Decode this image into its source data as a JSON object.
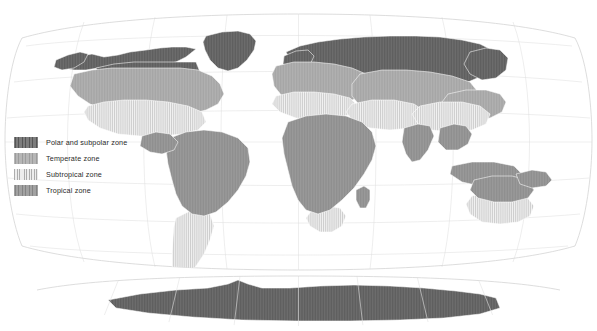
{
  "figure": {
    "kind": "world-climate-zone-map",
    "projection": "Robinson",
    "background_color": "#ffffff",
    "ocean_color": "#ffffff",
    "graticule_color": "#d8d8d8",
    "country_border_color": "#ffffff",
    "map_outline_color": "#cfcfcf",
    "width": 597,
    "height": 331
  },
  "legend": {
    "items": [
      {
        "id": "polar",
        "label": "Polar and subpolar zone",
        "color": "#6e6e6e",
        "hatch": "vertical",
        "swatch_class": "sw-polar"
      },
      {
        "id": "temperate",
        "label": "Temperate zone",
        "color": "#aeaeae",
        "hatch": "vertical",
        "swatch_class": "sw-temperate"
      },
      {
        "id": "subtropical",
        "label": "Subtropical zone",
        "color": "#ededed",
        "hatch": "vertical-light",
        "swatch_class": "sw-subtropical"
      },
      {
        "id": "tropical",
        "label": "Tropical zone",
        "color": "#979797",
        "hatch": "vertical",
        "swatch_class": "sw-tropical"
      }
    ]
  },
  "map_data": {
    "type": "choropleth-zones",
    "zone_order": [
      "polar",
      "temperate",
      "subtropical",
      "tropical"
    ],
    "landmasses": [
      {
        "name": "north-america-polar",
        "zone": "polar",
        "path": "M62,62 L74,57 L92,54 L104,57 L118,55 L130,52 L146,50 L160,48 L172,47 L186,47 L196,49 L186,57 L176,62 L166,64 L152,64 L140,63 L126,64 L112,66 L98,68 L86,70 L74,70 L64,68 Z"
      },
      {
        "name": "greenland-polar",
        "zone": "polar",
        "path": "M206,36 L222,32 L238,31 L250,34 L256,41 L254,50 L247,60 L238,68 L228,71 L218,68 L210,60 L205,50 L203,42 Z"
      },
      {
        "name": "alaska-polar",
        "zone": "polar",
        "path": "M56,60 L68,55 L80,52 L88,54 L84,62 L74,68 L62,70 L54,67 Z"
      },
      {
        "name": "canada-mid-polar",
        "zone": "polar",
        "path": "M96,68 L114,64 L134,62 L156,62 L178,62 L196,62 L200,72 L192,80 L176,84 L156,86 L136,86 L116,84 L100,78 Z"
      },
      {
        "name": "eurasia-polar-belt",
        "zone": "polar",
        "path": "M286,52 L300,46 L318,42 L340,39 L364,37 L390,36 L416,36 L440,37 L462,40 L480,44 L492,50 L496,58 L492,68 L482,76 L468,82 L448,86 L424,88 L398,88 L372,86 L348,82 L326,78 L306,72 L292,64 Z"
      },
      {
        "name": "scandinavia-polar",
        "zone": "polar",
        "path": "M284,56 L296,51 L308,50 L314,56 L310,65 L300,70 L290,70 L283,64 Z"
      },
      {
        "name": "siberia-ne-polar",
        "zone": "polar",
        "path": "M470,52 L486,48 L500,50 L508,58 L506,70 L496,78 L482,80 L470,74 L464,64 Z"
      },
      {
        "name": "mongolia-polar-lobe",
        "zone": "polar",
        "path": "M418,84 L436,80 L456,80 L470,84 L472,92 L462,98 L444,100 L426,98 L416,92 Z"
      },
      {
        "name": "north-america-temperate",
        "zone": "temperate",
        "path": "M74,74 L92,70 L112,68 L134,68 L158,68 L180,68 L198,70 L212,76 L220,84 L224,94 L218,104 L206,110 L190,114 L170,116 L148,116 L126,114 L106,110 L90,104 L78,96 L70,86 Z"
      },
      {
        "name": "europe-temperate",
        "zone": "temperate",
        "path": "M276,66 L294,62 L314,62 L334,64 L352,68 L366,74 L372,84 L366,94 L352,100 L334,104 L314,104 L296,102 L282,96 L274,86 L272,74 Z"
      },
      {
        "name": "central-asia-temperate",
        "zone": "temperate",
        "path": "M360,74 L382,70 L406,70 L430,72 L452,76 L470,82 L478,92 L474,102 L462,110 L444,114 L422,116 L398,116 L376,112 L360,106 L352,96 L352,84 Z"
      },
      {
        "name": "east-asia-temperate",
        "zone": "temperate",
        "path": "M448,94 L466,90 L486,90 L500,94 L506,102 L502,112 L490,118 L474,120 L458,118 L446,112 L442,102 Z"
      },
      {
        "name": "north-america-subtropical",
        "zone": "subtropical",
        "path": "M88,106 L104,102 L124,100 L146,100 L168,102 L188,106 L202,112 L206,122 L198,130 L182,134 L162,136 L140,136 L118,134 L100,128 L88,120 L84,112 Z"
      },
      {
        "name": "mediterranean-subtropical",
        "zone": "subtropical",
        "path": "M276,96 L294,92 L314,92 L334,94 L350,98 L358,106 L352,114 L336,118 L316,120 L296,118 L280,112 L272,104 Z"
      },
      {
        "name": "middle-east-subtropical",
        "zone": "subtropical",
        "path": "M352,104 L372,100 L394,100 L414,104 L426,112 L424,122 L410,128 L390,130 L370,128 L354,122 L346,112 Z"
      },
      {
        "name": "china-subtropical",
        "zone": "subtropical",
        "path": "M420,106 L440,102 L462,102 L480,106 L490,114 L486,124 L472,130 L452,132 L432,130 L418,124 L412,114 Z"
      },
      {
        "name": "south-america-subtropical",
        "zone": "subtropical",
        "path": "M176,218 L188,212 L200,210 L210,214 L214,226 L210,240 L204,254 L196,266 L188,276 L180,282 L174,278 L172,266 L172,252 L173,238 L174,226 Z"
      },
      {
        "name": "southern-africa-subtropical",
        "zone": "subtropical",
        "path": "M312,210 L326,206 L340,208 L346,216 L342,226 L332,232 L320,232 L310,226 L306,218 Z"
      },
      {
        "name": "australia-subtropical",
        "zone": "subtropical",
        "path": "M472,196 L490,192 L510,192 L526,196 L534,206 L530,216 L518,222 L500,224 L482,222 L470,214 L466,204 Z"
      },
      {
        "name": "south-america-tropical",
        "zone": "tropical",
        "path": "M170,138 L186,132 L204,130 L222,132 L238,138 L248,148 L250,162 L246,176 L238,190 L228,202 L216,212 L204,216 L192,214 L182,206 L176,194 L172,180 L168,164 L166,150 Z"
      },
      {
        "name": "central-america-tropical",
        "zone": "tropical",
        "path": "M142,136 L156,132 L170,134 L178,142 L174,150 L162,154 L150,152 L140,146 Z"
      },
      {
        "name": "africa-tropical",
        "zone": "tropical",
        "path": "M288,122 L306,116 L326,114 L346,116 L362,122 L372,132 L376,146 L372,160 L364,174 L354,188 L342,200 L330,210 L318,214 L306,210 L298,200 L292,186 L288,170 L284,154 L282,138 Z"
      },
      {
        "name": "madagascar-tropical",
        "zone": "tropical",
        "path": "M356,190 L364,186 L370,190 L370,200 L366,208 L360,208 L356,200 Z"
      },
      {
        "name": "india-tropical",
        "zone": "tropical",
        "path": "M404,128 L418,124 L430,126 L434,136 L428,150 L420,160 L412,162 L406,154 L402,142 Z"
      },
      {
        "name": "southeast-asia-tropical",
        "zone": "tropical",
        "path": "M440,128 L454,124 L466,126 L472,134 L468,144 L458,150 L446,150 L438,142 Z"
      },
      {
        "name": "indonesia-tropical",
        "zone": "tropical",
        "path": "M452,166 L472,162 L494,162 L514,166 L522,174 L516,182 L500,186 L480,186 L462,182 L450,174 Z"
      },
      {
        "name": "australia-tropical",
        "zone": "tropical",
        "path": "M474,180 L492,176 L512,176 L528,180 L534,190 L528,198 L512,202 L494,202 L478,198 L470,190 Z"
      },
      {
        "name": "new-guinea-tropical",
        "zone": "tropical",
        "path": "M516,174 L532,170 L546,172 L552,180 L546,186 L532,188 L520,184 Z"
      },
      {
        "name": "antarctica-polar",
        "zone": "polar",
        "path": "M108,300 L140,294 L176,290 L208,288 L228,284 L238,280 L248,284 L262,288 L290,288 L320,286 L354,285 L390,286 L424,288 L456,291 L480,294 L496,298 L500,308 L480,314 L444,318 L400,320 L350,321 L296,321 L242,320 L192,317 L148,313 L116,308 Z"
      }
    ]
  }
}
